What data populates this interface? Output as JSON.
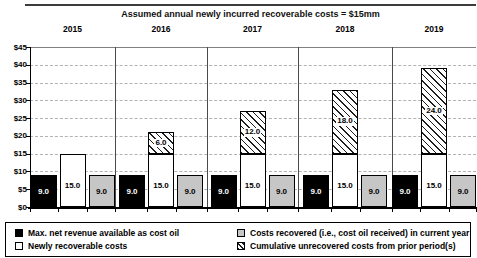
{
  "chart_data": {
    "type": "bar",
    "title": "Assumed annual newly incurred recoverable costs = $15mm",
    "categories": [
      "2015",
      "2016",
      "2017",
      "2018",
      "2019"
    ],
    "series": [
      {
        "name": "Max. net revenue available  as cost oil",
        "style": "black",
        "values": [
          9.0,
          9.0,
          9.0,
          9.0,
          9.0
        ]
      },
      {
        "name": "Newly recoverable costs",
        "style": "white",
        "values": [
          15.0,
          15.0,
          15.0,
          15.0,
          15.0
        ]
      },
      {
        "name": "Cumulative unrecovered costs from prior period(s)",
        "style": "hatch",
        "stacked_on": "Newly recoverable costs",
        "values": [
          0,
          6.0,
          12.0,
          18.0,
          24.0
        ]
      },
      {
        "name": "Costs recovered (i.e., cost oil received) in current year",
        "style": "gray",
        "values": [
          9.0,
          9.0,
          9.0,
          9.0,
          9.0
        ]
      }
    ],
    "ylim": [
      0,
      45
    ],
    "ytick_step": 5,
    "ytick_labels": [
      "$0",
      "$5",
      "$10",
      "$15",
      "$20",
      "$25",
      "$30",
      "$35",
      "$40",
      "$45"
    ],
    "grid": "dashed-horizontal",
    "legend_position": "bottom"
  },
  "legend": {
    "items": [
      {
        "label": "Max. net revenue available  as cost oil",
        "swatch": "black"
      },
      {
        "label": "Newly recoverable costs",
        "swatch": "white"
      },
      {
        "label": "Costs recovered (i.e., cost oil received) in current year",
        "swatch": "gray"
      },
      {
        "label": "Cumulative unrecovered costs from prior period(s)",
        "swatch": "hatch"
      }
    ]
  },
  "colors": {
    "bar_black": "#000000",
    "bar_white": "#ffffff",
    "bar_gray": "#c6c6c6",
    "hatch_line": "#1e1e1e",
    "grid_line": "#b2b2b2",
    "axis_line": "#000000",
    "divider_line": "#4a4a4a"
  }
}
